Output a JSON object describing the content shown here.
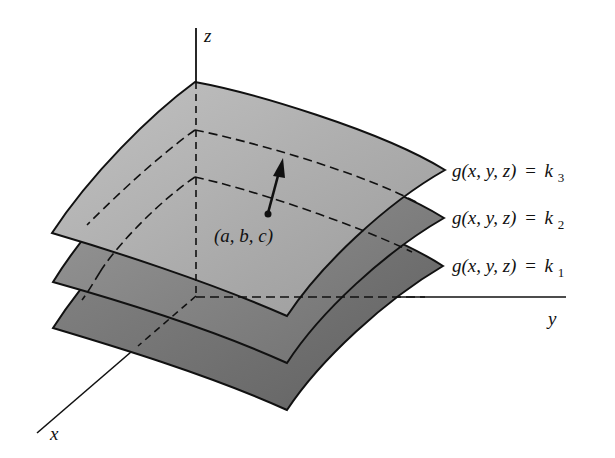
{
  "figure": {
    "axes": {
      "x_label": "x",
      "y_label": "y",
      "z_label": "z"
    },
    "surfaces": [
      {
        "id": "k3",
        "label_func": "g(x, y, z)",
        "label_eq": "=",
        "label_k": "k",
        "label_sub": "3",
        "fill": "#b4b4b4"
      },
      {
        "id": "k2",
        "label_func": "g(x, y, z)",
        "label_eq": "=",
        "label_k": "k",
        "label_sub": "2",
        "fill": "#8e8e8e"
      },
      {
        "id": "k1",
        "label_func": "g(x, y, z)",
        "label_eq": "=",
        "label_k": "k",
        "label_sub": "1",
        "fill": "#7a7a7a"
      }
    ],
    "point": {
      "label": "(a, b, c)"
    },
    "colors": {
      "outline": "#111111",
      "background": "#ffffff"
    }
  }
}
